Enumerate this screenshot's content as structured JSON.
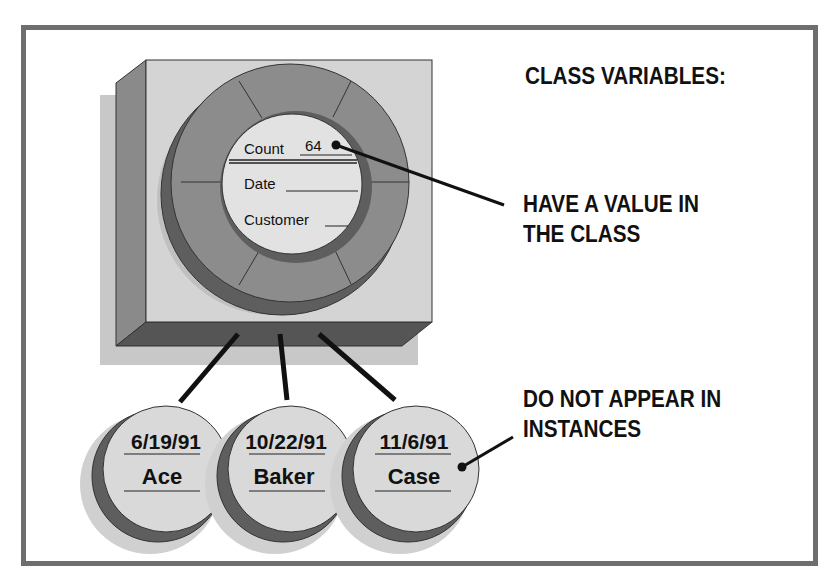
{
  "title": "CLASS VARIABLES:",
  "callout_class": {
    "line1": "HAVE A VALUE IN",
    "line2": "THE CLASS"
  },
  "callout_instances": {
    "line1": "DO NOT APPEAR IN",
    "line2": "INSTANCES"
  },
  "class_object": {
    "fields": [
      {
        "label": "Count",
        "value": "64"
      },
      {
        "label": "Date",
        "value": ""
      },
      {
        "label": "Customer",
        "value": ""
      }
    ]
  },
  "instances": [
    {
      "date": "6/19/91",
      "name": "Ace"
    },
    {
      "date": "10/22/91",
      "name": "Baker"
    },
    {
      "date": "11/6/91",
      "name": "Case"
    }
  ],
  "colors": {
    "frame": "#6e6e6e",
    "box_face": "#d4d4d4",
    "box_side": "#8a8a8a",
    "box_bottom": "#555555",
    "ring": "#8c8c8c",
    "ring_dark": "#5e5e5e",
    "shadow": "#c4c4c4",
    "core": "#e2e2e2"
  }
}
